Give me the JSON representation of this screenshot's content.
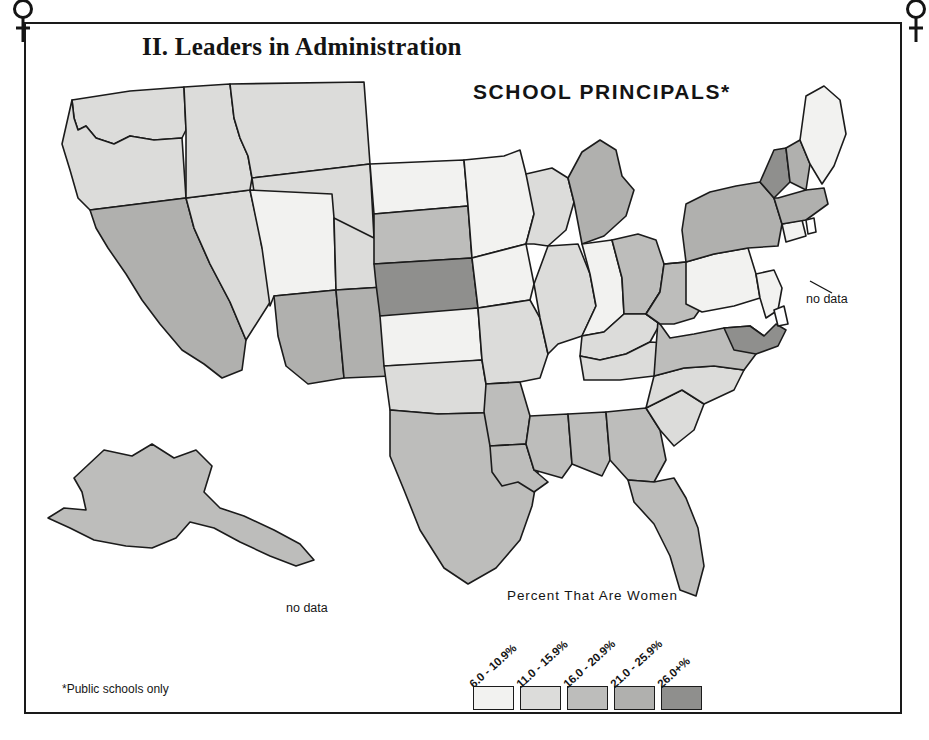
{
  "frame": {
    "corner_icon_left": "venus-symbol",
    "corner_icon_right": "venus-symbol"
  },
  "header": {
    "section_title": "II. Leaders in Administration",
    "map_title": "SCHOOL  PRINCIPALS*"
  },
  "annotations": {
    "hawaii_no_data": "no data",
    "northeast_no_data": "no data"
  },
  "legend": {
    "title": "Percent That Are Women",
    "entries": [
      {
        "label": "6.0 - 10.9%",
        "color": "#f2f2f0"
      },
      {
        "label": "11.0 - 15.9%",
        "color": "#dcdcda"
      },
      {
        "label": "16.0 - 20.9%",
        "color": "#bdbdbb"
      },
      {
        "label": "21.0 - 25.9%",
        "color": "#b0b0ae"
      },
      {
        "label": "26.0+%",
        "color": "#8f8f8d"
      }
    ]
  },
  "footnote": "*Public schools only",
  "chart_data": {
    "type": "map",
    "title": "SCHOOL PRINCIPALS*",
    "subtitle": "II. Leaders in Administration",
    "legend_title": "Percent That Are Women",
    "unit": "percent",
    "bins": [
      "6.0 - 10.9%",
      "11.0 - 15.9%",
      "16.0 - 20.9%",
      "21.0 - 25.9%",
      "26.0+%"
    ],
    "bin_colors": [
      "#f2f2f0",
      "#dcdcda",
      "#bdbdbb",
      "#b0b0ae",
      "#8f8f8d"
    ],
    "no_data_label": "no data",
    "no_data_regions": [
      "HI",
      "RI",
      "DE"
    ],
    "regions": [
      {
        "id": "WA",
        "name": "Washington",
        "bin": 1,
        "color": "#dcdcda"
      },
      {
        "id": "OR",
        "name": "Oregon",
        "bin": 1,
        "color": "#dcdcda"
      },
      {
        "id": "CA",
        "name": "California",
        "bin": 3,
        "color": "#b0b0ae"
      },
      {
        "id": "NV",
        "name": "Nevada",
        "bin": 1,
        "color": "#dcdcda"
      },
      {
        "id": "ID",
        "name": "Idaho",
        "bin": 1,
        "color": "#dcdcda"
      },
      {
        "id": "MT",
        "name": "Montana",
        "bin": 1,
        "color": "#dcdcda"
      },
      {
        "id": "WY",
        "name": "Wyoming",
        "bin": 1,
        "color": "#dcdcda"
      },
      {
        "id": "UT",
        "name": "Utah",
        "bin": 0,
        "color": "#f2f2f0"
      },
      {
        "id": "AZ",
        "name": "Arizona",
        "bin": 3,
        "color": "#b0b0ae"
      },
      {
        "id": "CO",
        "name": "Colorado",
        "bin": 1,
        "color": "#dcdcda"
      },
      {
        "id": "NM",
        "name": "New Mexico",
        "bin": 3,
        "color": "#b0b0ae"
      },
      {
        "id": "ND",
        "name": "North Dakota",
        "bin": 0,
        "color": "#f2f2f0"
      },
      {
        "id": "SD",
        "name": "South Dakota",
        "bin": 2,
        "color": "#bdbdbb"
      },
      {
        "id": "NE",
        "name": "Nebraska",
        "bin": 4,
        "color": "#8f8f8d"
      },
      {
        "id": "KS",
        "name": "Kansas",
        "bin": 0,
        "color": "#f2f2f0"
      },
      {
        "id": "OK",
        "name": "Oklahoma",
        "bin": 1,
        "color": "#dcdcda"
      },
      {
        "id": "TX",
        "name": "Texas",
        "bin": 2,
        "color": "#bdbdbb"
      },
      {
        "id": "MN",
        "name": "Minnesota",
        "bin": 0,
        "color": "#f2f2f0"
      },
      {
        "id": "IA",
        "name": "Iowa",
        "bin": 0,
        "color": "#f2f2f0"
      },
      {
        "id": "MO",
        "name": "Missouri",
        "bin": 1,
        "color": "#dcdcda"
      },
      {
        "id": "AR",
        "name": "Arkansas",
        "bin": 2,
        "color": "#bdbdbb"
      },
      {
        "id": "LA",
        "name": "Louisiana",
        "bin": 2,
        "color": "#bdbdbb"
      },
      {
        "id": "WI",
        "name": "Wisconsin",
        "bin": 1,
        "color": "#dcdcda"
      },
      {
        "id": "IL",
        "name": "Illinois",
        "bin": 1,
        "color": "#dcdcda"
      },
      {
        "id": "MI",
        "name": "Michigan",
        "bin": 3,
        "color": "#b0b0ae"
      },
      {
        "id": "IN",
        "name": "Indiana",
        "bin": 0,
        "color": "#f2f2f0"
      },
      {
        "id": "OH",
        "name": "Ohio",
        "bin": 2,
        "color": "#bdbdbb"
      },
      {
        "id": "KY",
        "name": "Kentucky",
        "bin": 1,
        "color": "#dcdcda"
      },
      {
        "id": "TN",
        "name": "Tennessee",
        "bin": 1,
        "color": "#dcdcda"
      },
      {
        "id": "MS",
        "name": "Mississippi",
        "bin": 2,
        "color": "#bdbdbb"
      },
      {
        "id": "AL",
        "name": "Alabama",
        "bin": 2,
        "color": "#bdbdbb"
      },
      {
        "id": "GA",
        "name": "Georgia",
        "bin": 2,
        "color": "#bdbdbb"
      },
      {
        "id": "FL",
        "name": "Florida",
        "bin": 2,
        "color": "#bdbdbb"
      },
      {
        "id": "SC",
        "name": "South Carolina",
        "bin": 1,
        "color": "#dcdcda"
      },
      {
        "id": "NC",
        "name": "North Carolina",
        "bin": 1,
        "color": "#dcdcda"
      },
      {
        "id": "VA",
        "name": "Virginia",
        "bin": 2,
        "color": "#bdbdbb"
      },
      {
        "id": "WV",
        "name": "West Virginia",
        "bin": 2,
        "color": "#bdbdbb"
      },
      {
        "id": "MD",
        "name": "Maryland",
        "bin": 4,
        "color": "#8f8f8d"
      },
      {
        "id": "PA",
        "name": "Pennsylvania",
        "bin": 0,
        "color": "#f2f2f0"
      },
      {
        "id": "NJ",
        "name": "New Jersey",
        "bin": 0,
        "color": "#f2f2f0"
      },
      {
        "id": "NY",
        "name": "New York",
        "bin": 3,
        "color": "#b0b0ae"
      },
      {
        "id": "CT",
        "name": "Connecticut",
        "bin": 0,
        "color": "#f2f2f0"
      },
      {
        "id": "MA",
        "name": "Massachusetts",
        "bin": 3,
        "color": "#b0b0ae"
      },
      {
        "id": "VT",
        "name": "Vermont",
        "bin": 4,
        "color": "#8f8f8d"
      },
      {
        "id": "NH",
        "name": "New Hampshire",
        "bin": 3,
        "color": "#b0b0ae"
      },
      {
        "id": "ME",
        "name": "Maine",
        "bin": 0,
        "color": "#f2f2f0"
      },
      {
        "id": "AK",
        "name": "Alaska",
        "bin": 2,
        "color": "#bdbdbb"
      },
      {
        "id": "HI",
        "name": "Hawaii",
        "bin": null,
        "color": "#ffffff"
      },
      {
        "id": "RI",
        "name": "Rhode Island",
        "bin": null,
        "color": "#ffffff"
      },
      {
        "id": "DE",
        "name": "Delaware",
        "bin": null,
        "color": "#ffffff"
      }
    ]
  }
}
